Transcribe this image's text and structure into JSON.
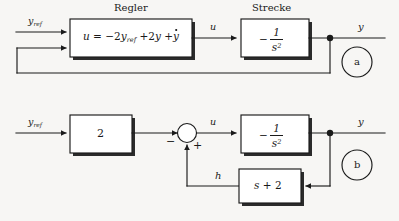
{
  "figure": {
    "title_a": "Regler",
    "title_b": "Strecke",
    "variant_a_label": "a",
    "variant_b_label": "b"
  },
  "diagram_a": {
    "controller": {
      "caption": "Regler",
      "eq_u": "u",
      "eq_equals": "=",
      "eq_term1_sign": "−",
      "eq_term1_coeff": "2",
      "eq_term1_var": "y",
      "eq_term1_sub": "ref",
      "eq_term2_sign": "+",
      "eq_term2_coeff": "2",
      "eq_term2_var": "y",
      "eq_term3_sign": "+",
      "eq_term3_var": "y"
    },
    "plant": {
      "caption": "Strecke",
      "minus": "−",
      "numerator": "1",
      "denominator": "s",
      "den_exponent": "2"
    },
    "signals": {
      "input": "y",
      "input_sub": "ref",
      "control": "u",
      "output": "y"
    },
    "badge": "a"
  },
  "diagram_b": {
    "gain": {
      "value": "2"
    },
    "sum_junction": {
      "sign_left": "−",
      "sign_bottom": "+"
    },
    "plant": {
      "minus": "−",
      "numerator": "1",
      "denominator": "s",
      "den_exponent": "2"
    },
    "feedback": {
      "var": "s",
      "op": "+",
      "const": "2"
    },
    "signals": {
      "input": "y",
      "input_sub": "ref",
      "control": "u",
      "feedback_signal": "h",
      "output": "y"
    },
    "badge": "b"
  },
  "style": {
    "ink": "#1a1a1a",
    "paper": "#f7f6f4",
    "shadow": "#2b2b2b"
  }
}
